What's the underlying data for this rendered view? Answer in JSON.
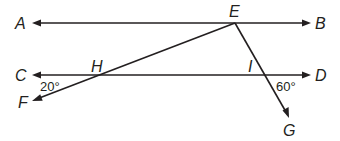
{
  "diagram": {
    "type": "geometry",
    "points": {
      "A": {
        "label": "A"
      },
      "B": {
        "label": "B"
      },
      "C": {
        "label": "C"
      },
      "D": {
        "label": "D"
      },
      "E": {
        "label": "E"
      },
      "F": {
        "label": "F"
      },
      "G": {
        "label": "G"
      },
      "H": {
        "label": "H"
      },
      "I": {
        "label": "I"
      }
    },
    "lines": [
      {
        "name": "AB",
        "from": "A",
        "to": "B",
        "arrows": "both"
      },
      {
        "name": "CD",
        "from": "C",
        "to": "D",
        "arrows": "both"
      },
      {
        "name": "EF",
        "from": "E",
        "to": "F",
        "through": "H",
        "arrows": "F"
      },
      {
        "name": "EG",
        "from": "E",
        "to": "G",
        "through": "I",
        "arrows": "G"
      }
    ],
    "angles": {
      "angle_CHF": {
        "label": "20°",
        "vertex": "H"
      },
      "angle_DIG": {
        "label": "60°",
        "vertex": "I"
      }
    },
    "colors": {
      "ink": "#231f20",
      "background": "#ffffff"
    }
  }
}
